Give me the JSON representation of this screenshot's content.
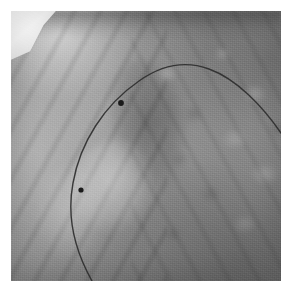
{
  "image": {
    "kind": "fluoroscopy-radiograph",
    "modality_label": "Fluoroscopic chest radiograph",
    "alt_text": "Grayscale fluoroscopic chest image showing a thin radiopaque catheter arcing from the lower left, up across the cardiac silhouette, and exiting the right border, with two radiopaque marker dots along its course.",
    "canvas": {
      "width": 291,
      "height": 292,
      "background": "#ffffff"
    },
    "frame": {
      "left": 11,
      "top": 11,
      "width": 270,
      "height": 270,
      "border_color": "#ffffff"
    },
    "palette": {
      "background": "#ffffff",
      "field_light": "#9a9a9a",
      "field_mid": "#8d8d8d",
      "field_dark": "#6f6f6f",
      "apex_highlight": "#ffffff",
      "wire_stroke": "#2e2e2e",
      "marker_fill": "#1a1a1a"
    }
  },
  "regions": [
    {
      "name": "apex-highlight-wedge",
      "label": "Bright collimated apex wedge",
      "corner": "top-left"
    },
    {
      "name": "cardiac-silhouette",
      "label": "Cardiac / mediastinal silhouette",
      "corner": "center-left"
    },
    {
      "name": "diaphragm-lobe",
      "label": "Diaphragmatic lobe",
      "corner": "lower-left"
    },
    {
      "name": "rib-shadows",
      "label": "Rib shadow bands",
      "corner": "bilateral"
    },
    {
      "name": "lung-parenchyma",
      "label": "Mottled lung parenchyma",
      "corner": "right"
    }
  ],
  "overlay": {
    "catheter": {
      "label": "Catheter / guidewire",
      "stroke_color": "#2e2e2e",
      "stroke_width": 1.4,
      "path": "M 81 270 C 63 238, 56 204, 62 172 C 69 132, 93 94, 128 70 C 152 53, 176 50, 198 58 C 226 68, 252 96, 270 122"
    },
    "markers": [
      {
        "name": "marker-proximal",
        "label": "Radiopaque marker 1",
        "cx": 110,
        "cy": 92,
        "r": 2.9,
        "fill": "#1a1a1a"
      },
      {
        "name": "marker-distal",
        "label": "Radiopaque marker 2",
        "cx": 70,
        "cy": 179,
        "r": 2.6,
        "fill": "#1a1a1a"
      }
    ]
  }
}
